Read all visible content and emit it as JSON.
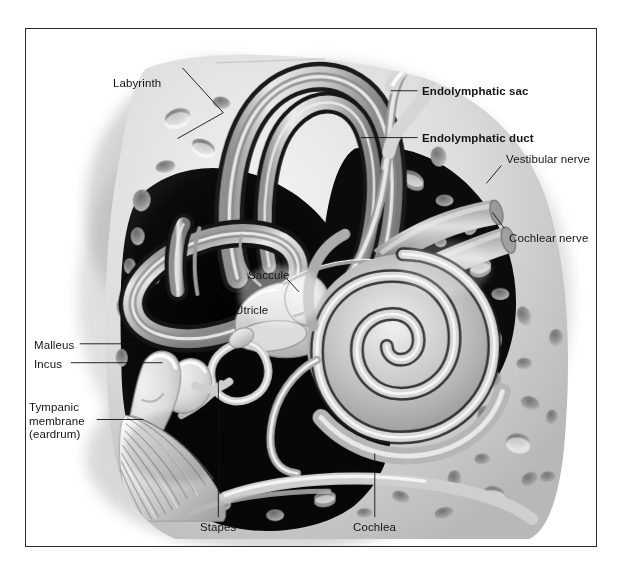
{
  "figure": {
    "type": "anatomical-illustration",
    "style": "grayscale medical illustration with black frame border",
    "colors": {
      "frame": "#2b2b2b",
      "background": "#ffffff",
      "bone_light": "#e2e2e2",
      "bone_mid": "#bdbdbd",
      "bone_shadow": "#8f8f8f",
      "cavity_dark": "#0d0d0d",
      "duct_gray": "#9a9a9a",
      "label_text": "#141414"
    }
  },
  "labels": [
    {
      "id": "labyrinth",
      "text": "Labyrinth",
      "bold": false,
      "x": 112,
      "y": 55,
      "align": "left",
      "leaders": [
        {
          "from_x": 157,
          "from_y": 67,
          "to_x": 196,
          "to_y": 110
        },
        {
          "from_x": 157,
          "from_y": 67,
          "to_x": 196,
          "to_y": 110,
          "to2_x": 152,
          "to2_y": 137
        }
      ]
    },
    {
      "id": "endolymphatic-sac",
      "text": "Endolymphatic sac",
      "bold": true,
      "x": 421,
      "y": 84,
      "align": "left",
      "leaders": [
        {
          "from_x": 418,
          "from_y": 90,
          "to_x": 390,
          "to_y": 90
        }
      ]
    },
    {
      "id": "endolymphatic-duct",
      "text": "Endolymphatic duct",
      "bold": true,
      "x": 421,
      "y": 131,
      "align": "left",
      "leaders": [
        {
          "from_x": 418,
          "from_y": 137,
          "to_x": 360,
          "to_y": 137
        }
      ]
    },
    {
      "id": "vestibular-nerve",
      "text": "Vestibular nerve",
      "bold": false,
      "x": 505,
      "y": 153,
      "align": "left",
      "leaders": [
        {
          "from_x": 502,
          "from_y": 165,
          "to_x": 487,
          "to_y": 183
        }
      ]
    },
    {
      "id": "cochlear-nerve",
      "text": "Cochlear nerve",
      "bold": false,
      "x": 508,
      "y": 231,
      "align": "left",
      "leaders": [
        {
          "from_x": 505,
          "from_y": 228,
          "to_x": 492,
          "to_y": 212
        }
      ]
    },
    {
      "id": "saccule",
      "text": "Saccule",
      "bold": false,
      "x": 247,
      "y": 268,
      "align": "left",
      "leaders": [
        {
          "from_x": 287,
          "from_y": 279,
          "to_x": 298,
          "to_y": 290
        }
      ]
    },
    {
      "id": "utricle",
      "text": "Utricle",
      "bold": false,
      "x": 234,
      "y": 303,
      "align": "left",
      "leaders": [
        {
          "from_x": 231,
          "from_y": 305,
          "to_x": 214,
          "to_y": 287
        }
      ]
    },
    {
      "id": "malleus",
      "text": "Malleus",
      "bold": false,
      "x": 33,
      "y": 338,
      "align": "left",
      "leaders": [
        {
          "from_x": 79,
          "from_y": 344,
          "to_x": 139,
          "to_y": 344
        }
      ]
    },
    {
      "id": "incus",
      "text": "Incus",
      "bold": false,
      "x": 33,
      "y": 357,
      "align": "left",
      "leaders": [
        {
          "from_x": 70,
          "from_y": 363,
          "to_x": 162,
          "to_y": 363
        }
      ]
    },
    {
      "id": "tympanic-membrane",
      "text": "Tympanic\nmembrane\n(eardrum)",
      "bold": false,
      "x": 28,
      "y": 400,
      "align": "left",
      "leaders": [
        {
          "from_x": 96,
          "from_y": 420,
          "to_x": 143,
          "to_y": 420
        }
      ]
    },
    {
      "id": "stapes",
      "text": "Stapes",
      "bold": false,
      "x": 199,
      "y": 524,
      "align": "left",
      "leaders": [
        {
          "from_x": 218,
          "from_y": 518,
          "to_x": 218,
          "to_y": 370
        }
      ]
    },
    {
      "id": "cochlea",
      "text": "Cochlea",
      "bold": false,
      "x": 352,
      "y": 524,
      "align": "left",
      "leaders": [
        {
          "from_x": 375,
          "from_y": 518,
          "to_x": 375,
          "to_y": 452
        }
      ]
    }
  ]
}
